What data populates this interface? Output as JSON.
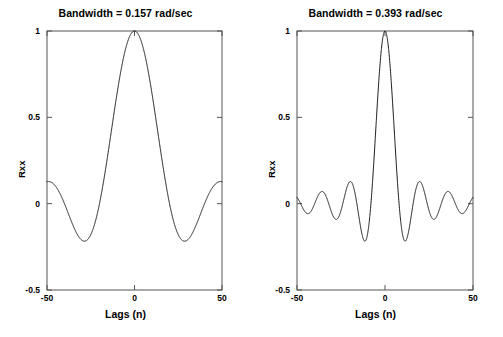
{
  "figure": {
    "background": "#ffffff",
    "line_color": "#1a1a1a",
    "axis_color": "#555555",
    "width": 503,
    "height": 337
  },
  "panels": [
    {
      "id": "left",
      "title": "Bandwidth = 0.157 rad/sec",
      "xlabel": "Lags (n)",
      "ylabel": "Rxx",
      "xticks": [
        "-50",
        "0",
        "50"
      ],
      "yticks": [
        "1",
        "0.5",
        "0",
        "-0.5"
      ]
    },
    {
      "id": "right",
      "title": "Bandwidth = 0.393 rad/sec",
      "xlabel": "Lags (n)",
      "ylabel": "Rxx",
      "xticks": [
        "-50",
        "0",
        "50"
      ],
      "yticks": [
        "1",
        "0.5",
        "0",
        "-0.5"
      ]
    }
  ],
  "chart_data": [
    {
      "type": "line",
      "title": "Bandwidth = 0.157 rad/sec",
      "xlabel": "Lags (n)",
      "ylabel": "Rxx",
      "xlim": [
        -50,
        50
      ],
      "ylim": [
        -0.5,
        1
      ],
      "xticks": [
        -50,
        0,
        50
      ],
      "yticks": [
        -0.5,
        0,
        0.5,
        1
      ],
      "grid": false,
      "legend": null,
      "series": [
        {
          "name": "Rxx",
          "function": "sinc-like autocorrelation, bandwidth 0.157 rad/sec",
          "bandwidth_rad_per_sec": 0.157,
          "x": [
            -50,
            -45,
            -40,
            -35,
            -30,
            -25,
            -20,
            -15,
            -10,
            -5,
            0,
            5,
            10,
            15,
            20,
            25,
            30,
            35,
            40,
            45,
            50
          ],
          "y": [
            0.07,
            -0.09,
            -0.22,
            -0.29,
            -0.3,
            -0.25,
            -0.12,
            0.08,
            0.43,
            0.8,
            1.0,
            0.8,
            0.43,
            0.08,
            -0.12,
            -0.25,
            -0.3,
            -0.29,
            -0.22,
            -0.09,
            0.07
          ]
        }
      ]
    },
    {
      "type": "line",
      "title": "Bandwidth = 0.393 rad/sec",
      "xlabel": "Lags (n)",
      "ylabel": "Rxx",
      "xlim": [
        -50,
        50
      ],
      "ylim": [
        -0.5,
        1
      ],
      "xticks": [
        -50,
        0,
        50
      ],
      "yticks": [
        -0.5,
        0,
        0.5,
        1
      ],
      "grid": false,
      "legend": null,
      "series": [
        {
          "name": "Rxx",
          "function": "sinc-like autocorrelation, bandwidth 0.393 rad/sec",
          "bandwidth_rad_per_sec": 0.393,
          "x": [
            -50,
            -46,
            -42,
            -38,
            -34,
            -30,
            -26,
            -22,
            -18,
            -14,
            -10,
            -6,
            -2,
            0,
            2,
            6,
            10,
            14,
            18,
            22,
            26,
            30,
            34,
            38,
            42,
            46,
            50
          ],
          "y": [
            -0.15,
            -0.18,
            -0.02,
            0.12,
            -0.02,
            -0.22,
            -0.12,
            0.13,
            0.13,
            -0.12,
            -0.18,
            0.23,
            0.92,
            1.0,
            0.92,
            0.23,
            -0.18,
            -0.12,
            0.13,
            0.13,
            -0.12,
            -0.22,
            -0.02,
            0.12,
            -0.02,
            -0.18,
            -0.15
          ]
        }
      ]
    }
  ]
}
